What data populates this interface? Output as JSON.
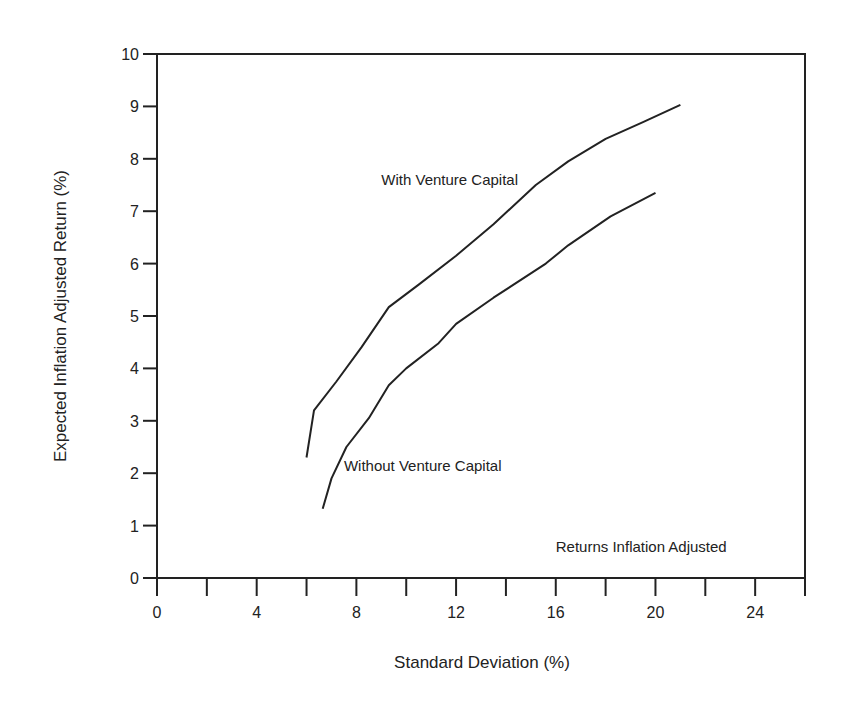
{
  "chart_data": {
    "type": "line",
    "title": "",
    "xlabel": "Standard Deviation (%)",
    "ylabel": "Expected Inflation Adjusted Return (%)",
    "xlim": [
      0,
      26
    ],
    "ylim": [
      0,
      10
    ],
    "x_ticks": [
      0,
      2,
      4,
      6,
      8,
      10,
      12,
      14,
      16,
      18,
      20,
      22,
      24,
      26
    ],
    "x_tick_labels": [
      "0",
      "4",
      "8",
      "12",
      "16",
      "20",
      "24"
    ],
    "x_tick_label_values": [
      0,
      4,
      8,
      12,
      16,
      20,
      24
    ],
    "y_ticks": [
      0,
      1,
      2,
      3,
      4,
      5,
      6,
      7,
      8,
      9,
      10
    ],
    "y_tick_labels": [
      "0",
      "1",
      "2",
      "3",
      "4",
      "5",
      "6",
      "7",
      "8",
      "9",
      "10"
    ],
    "grid": false,
    "legend": "none",
    "series": [
      {
        "name": "With Venture Capital",
        "x": [
          6.0,
          6.3,
          7.2,
          8.2,
          9.3,
          10.5,
          12.0,
          13.5,
          15.2,
          16.5,
          18.0,
          19.5,
          21.0
        ],
        "y": [
          2.3,
          3.2,
          3.75,
          4.4,
          5.17,
          5.6,
          6.15,
          6.75,
          7.5,
          7.95,
          8.38,
          8.7,
          9.03
        ]
      },
      {
        "name": "Without Venture Capital",
        "x": [
          6.65,
          7.0,
          7.6,
          8.5,
          9.3,
          10.0,
          11.3,
          12.0,
          13.5,
          15.6,
          16.5,
          18.2,
          20.0
        ],
        "y": [
          1.32,
          1.9,
          2.5,
          3.05,
          3.68,
          4.0,
          4.48,
          4.85,
          5.35,
          6.0,
          6.35,
          6.9,
          7.35
        ]
      }
    ],
    "annotations": [
      {
        "text": "With Venture Capital",
        "x": 9.0,
        "y": 7.5
      },
      {
        "text": "Without Venture Capital",
        "x": 7.5,
        "y": 2.05
      },
      {
        "text": "Returns Inflation Adjusted",
        "x": 16.0,
        "y": 0.5
      }
    ]
  }
}
